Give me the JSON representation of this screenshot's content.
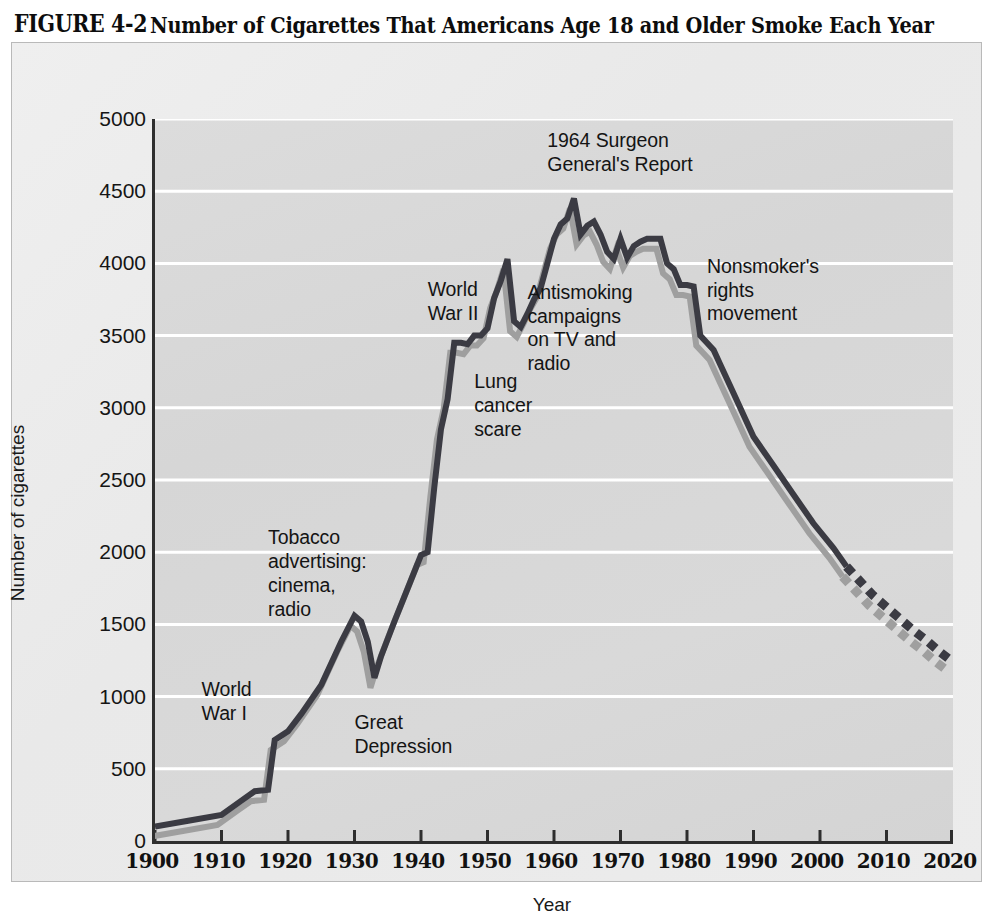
{
  "figure": {
    "label": "FIGURE 4-2",
    "title": "Number of Cigarettes That Americans Age 18 and Older Smoke Each Year"
  },
  "colors": {
    "line_main": "#3b3b43",
    "line_shadow": "#9f9f9f",
    "plot_background": "#d8d8d8",
    "gridline": "#ffffff",
    "axis": "#2e2e2e",
    "plate_background": "#ececec",
    "text": "#141414"
  },
  "chart_data": {
    "type": "line",
    "title": "Number of Cigarettes That Americans Age 18 and Older Smoke Each Year",
    "xlabel": "Year",
    "ylabel": "Number of cigarettes",
    "xlim": [
      1900,
      2020
    ],
    "ylim": [
      0,
      5000
    ],
    "xticks": [
      1900,
      1910,
      1920,
      1930,
      1940,
      1950,
      1960,
      1970,
      1980,
      1990,
      2000,
      2010,
      2020
    ],
    "yticks": [
      0,
      500,
      1000,
      1500,
      2000,
      2500,
      3000,
      3500,
      4000,
      4500,
      5000
    ],
    "grid": "horizontal",
    "legend": "none",
    "series": [
      {
        "name": "Cigarettes per adult per year",
        "style": "solid",
        "x": [
          1900,
          1905,
          1910,
          1913,
          1915,
          1916,
          1917,
          1918,
          1920,
          1922,
          1925,
          1928,
          1930,
          1931,
          1932,
          1933,
          1934,
          1936,
          1938,
          1940,
          1941,
          1942,
          1943,
          1944,
          1945,
          1946,
          1947,
          1948,
          1949,
          1950,
          1951,
          1952,
          1953,
          1954,
          1955,
          1956,
          1957,
          1958,
          1959,
          1960,
          1961,
          1962,
          1963,
          1964,
          1965,
          1966,
          1967,
          1968,
          1969,
          1970,
          1971,
          1972,
          1973,
          1974,
          1975,
          1976,
          1977,
          1978,
          1979,
          1980,
          1981,
          1982,
          1983,
          1984,
          1985,
          1987,
          1990,
          1993,
          1996,
          1999,
          2002,
          2004
        ],
        "y": [
          100,
          140,
          180,
          280,
          345,
          350,
          355,
          700,
          760,
          880,
          1080,
          1380,
          1560,
          1520,
          1380,
          1130,
          1280,
          1520,
          1750,
          1980,
          2000,
          2450,
          2850,
          3060,
          3450,
          3450,
          3440,
          3500,
          3500,
          3550,
          3760,
          3880,
          4030,
          3600,
          3560,
          3650,
          3750,
          3830,
          4000,
          4170,
          4270,
          4310,
          4450,
          4200,
          4260,
          4290,
          4200,
          4080,
          4030,
          4170,
          4040,
          4120,
          4150,
          4170,
          4170,
          4170,
          4000,
          3960,
          3850,
          3850,
          3840,
          3500,
          3450,
          3400,
          3300,
          3100,
          2800,
          2600,
          2400,
          2200,
          2030,
          1900
        ]
      },
      {
        "name": "Projection",
        "style": "dashed",
        "x": [
          2004,
          2006,
          2008,
          2010,
          2012,
          2014,
          2016,
          2018,
          2020
        ],
        "y": [
          1900,
          1800,
          1700,
          1620,
          1540,
          1460,
          1390,
          1310,
          1240
        ]
      }
    ],
    "annotations": [
      {
        "id": "world-war-i",
        "text": "World\nWar I",
        "x_year": 1907,
        "y_value": 1130
      },
      {
        "id": "tobacco-advertising",
        "text": "Tobacco\nadvertising:\ncinema,\nradio",
        "x_year": 1917,
        "y_value": 2180
      },
      {
        "id": "great-depression",
        "text": "Great\nDepression",
        "x_year": 1930,
        "y_value": 900
      },
      {
        "id": "world-war-ii",
        "text": "World\nWar II",
        "x_year": 1941,
        "y_value": 3900
      },
      {
        "id": "lung-cancer-scare",
        "text": "Lung\ncancer\nscare",
        "x_year": 1948,
        "y_value": 3260
      },
      {
        "id": "antismoking-campaigns",
        "text": "Antismoking\ncampaigns\non TV and\nradio",
        "x_year": 1956,
        "y_value": 3880
      },
      {
        "id": "surgeon-general-report",
        "text": "1964 Surgeon\nGeneral's Report",
        "x_year": 1959,
        "y_value": 4930
      },
      {
        "id": "nonsmokers-rights",
        "text": "Nonsmoker's\nrights\nmovement",
        "x_year": 1983,
        "y_value": 4060
      }
    ]
  }
}
